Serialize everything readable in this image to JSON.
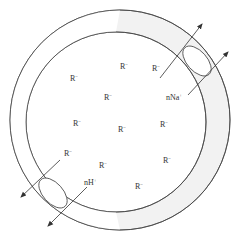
{
  "diagram": {
    "colors": {
      "stroke": "#444444",
      "ring_fill": "#f0f0f0",
      "background": "#ffffff",
      "text": "#333333"
    },
    "fixed_ions": [
      {
        "label": "R",
        "charge": "−",
        "x": 72,
        "y": 79
      },
      {
        "label": "R",
        "charge": "−",
        "x": 122,
        "y": 69
      },
      {
        "label": "R",
        "charge": "−",
        "x": 152,
        "y": 71
      },
      {
        "label": "R",
        "charge": "−",
        "x": 103,
        "y": 100
      },
      {
        "label": "R",
        "charge": "−",
        "x": 73,
        "y": 125
      },
      {
        "label": "R",
        "charge": "−",
        "x": 119,
        "y": 131
      },
      {
        "label": "R",
        "charge": "−",
        "x": 162,
        "y": 126
      },
      {
        "label": "R",
        "charge": "−",
        "x": 64,
        "y": 154
      },
      {
        "label": "R",
        "charge": "−",
        "x": 99,
        "y": 167
      },
      {
        "label": "R",
        "charge": "−",
        "x": 165,
        "y": 162
      },
      {
        "label": "R",
        "charge": "−",
        "x": 159,
        "y": 161
      },
      {
        "label": "R",
        "charge": "−",
        "x": 143,
        "y": 189
      }
    ],
    "exchange_in": {
      "label": "nNa",
      "charge": "+"
    },
    "exchange_out": {
      "label": "nH",
      "charge": "+"
    },
    "top_r_label": {
      "label": "R",
      "charge": "−"
    },
    "bottom_r_label": {
      "label": "R",
      "charge": "−"
    }
  }
}
